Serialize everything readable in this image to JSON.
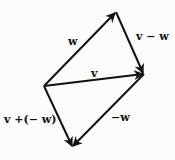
{
  "diagram": {
    "stroke_color": "#111111",
    "background": "#fbfbfb",
    "points": {
      "origin": [
        44,
        86
      ],
      "w_tip": [
        116,
        12
      ],
      "v_tip": [
        144,
        74
      ],
      "neg_w_tip": [
        72,
        147
      ]
    },
    "vectors": [
      {
        "id": "w",
        "label": "w",
        "from": "origin",
        "to": "w_tip"
      },
      {
        "id": "v",
        "label": "v",
        "from": "origin",
        "to": "v_tip"
      },
      {
        "id": "v_minus_w",
        "label": "v − w",
        "from": "w_tip",
        "to": "v_tip"
      },
      {
        "id": "neg_w",
        "label": "−w",
        "from": "v_tip",
        "to": "neg_w_tip"
      },
      {
        "id": "v_plus_neg_w",
        "label": "v +(− w)",
        "from": "origin",
        "to": "neg_w_tip"
      }
    ],
    "labels": {
      "w": "w",
      "v": "v",
      "v_minus_w": "v − w",
      "neg_w": "−w",
      "v_plus_neg_w": "v +(− w)"
    }
  }
}
